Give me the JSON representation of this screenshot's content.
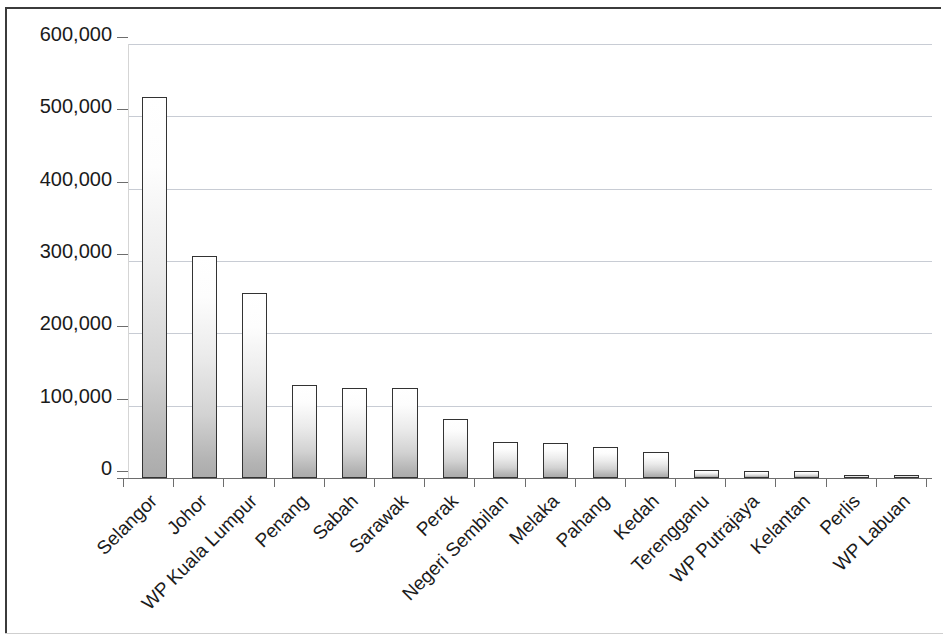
{
  "chart_data": {
    "type": "bar",
    "title": "",
    "xlabel": "",
    "ylabel": "",
    "ylim": [
      0,
      600000
    ],
    "grid": true,
    "legend": null,
    "y_ticks": [
      "600,000",
      "500,000",
      "400,000",
      "300,000",
      "200,000",
      "100,000",
      "0"
    ],
    "y_tick_values": [
      600000,
      500000,
      400000,
      300000,
      200000,
      100000,
      0
    ],
    "categories": [
      "Selangor",
      "Johor",
      "WP Kuala Lumpur",
      "Penang",
      "Sabah",
      "Sarawak",
      "Perak",
      "Negeri Sembilan",
      "Melaka",
      "Pahang",
      "Kedah",
      "Terengganu",
      "WP Putrajaya",
      "Kelantan",
      "Perlis",
      "WP Labuan"
    ],
    "values": [
      527000,
      307000,
      256000,
      128000,
      125000,
      125000,
      82000,
      50000,
      49000,
      43000,
      36000,
      11000,
      10000,
      9000,
      4000,
      3500
    ],
    "bar_style": {
      "fill": "vertical-gradient-white-to-gray",
      "fill_top": "#ffffff",
      "fill_bottom": "#ababab",
      "border": "#333333"
    },
    "gridline_color": "#c8ccd4",
    "axis_color": "#6d6d6d",
    "frame_color": "#3b3b3b",
    "label_rotation_degrees": -45
  }
}
